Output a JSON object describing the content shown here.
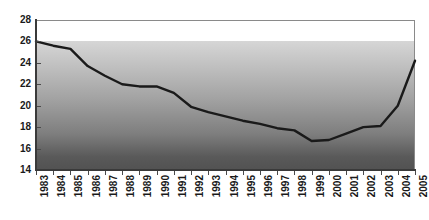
{
  "chart_data": {
    "type": "line",
    "title": "",
    "subtitle": "",
    "xlabel": "",
    "ylabel": "",
    "grid": false,
    "legend": false,
    "legend_position": "none",
    "series_color": "#1a1a1a",
    "plot_gradient_top_color": "#d8d8d8",
    "plot_gradient_bottom_color": "#525252",
    "xlim": [
      1983,
      2005
    ],
    "ylim": [
      14,
      28
    ],
    "ytick_step": 2,
    "ytick_labels": [
      "28",
      "26",
      "24",
      "22",
      "20",
      "18",
      "16",
      "14"
    ],
    "ytick_values": [
      28,
      26,
      24,
      22,
      20,
      18,
      16,
      14
    ],
    "categories": [
      "1983",
      "1984",
      "1985",
      "1986",
      "1987",
      "1988",
      "1989",
      "1990",
      "1991",
      "1992",
      "1993",
      "1994",
      "1995",
      "1996",
      "1997",
      "1998",
      "1999",
      "2000",
      "2001",
      "2002",
      "2003",
      "2004",
      "2005"
    ],
    "values": [
      26.0,
      25.6,
      25.3,
      23.7,
      22.8,
      22.0,
      21.8,
      21.8,
      21.2,
      19.9,
      19.4,
      19.0,
      18.6,
      18.3,
      17.9,
      17.7,
      16.7,
      16.8,
      17.4,
      18.0,
      18.1,
      20.0,
      24.2
    ],
    "series": [
      {
        "name": "series-1",
        "values": [
          26.0,
          25.6,
          25.3,
          23.7,
          22.8,
          22.0,
          21.8,
          21.8,
          21.2,
          19.9,
          19.4,
          19.0,
          18.6,
          18.3,
          17.9,
          17.7,
          16.7,
          16.8,
          17.4,
          18.0,
          18.1,
          20.0,
          24.2
        ]
      }
    ],
    "annotations": []
  }
}
